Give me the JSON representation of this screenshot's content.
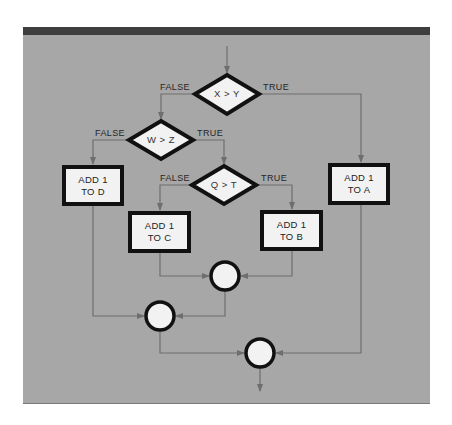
{
  "diagram": {
    "type": "flowchart",
    "colors": {
      "background": "#a7a7a7",
      "top_bar": "#3e3e3e",
      "shape_fill": "#f2f2f2",
      "shape_border": "#111111",
      "connector": "#6e6e6e"
    },
    "decisions": [
      {
        "id": "d1",
        "label": "X > Y",
        "false_label": "FALSE",
        "true_label": "TRUE"
      },
      {
        "id": "d2",
        "label": "W > Z",
        "false_label": "FALSE",
        "true_label": "TRUE"
      },
      {
        "id": "d3",
        "label": "Q > T",
        "false_label": "FALSE",
        "true_label": "TRUE"
      }
    ],
    "processes": [
      {
        "id": "pA",
        "line1": "ADD 1",
        "line2": "TO A"
      },
      {
        "id": "pB",
        "line1": "ADD 1",
        "line2": "TO B"
      },
      {
        "id": "pC",
        "line1": "ADD 1",
        "line2": "TO C"
      },
      {
        "id": "pD",
        "line1": "ADD 1",
        "line2": "TO D"
      }
    ],
    "connectors": [
      {
        "id": "j1",
        "joins": [
          "pC",
          "pB"
        ]
      },
      {
        "id": "j2",
        "joins": [
          "pD",
          "j1"
        ]
      },
      {
        "id": "j3",
        "joins": [
          "j2",
          "pA"
        ]
      }
    ]
  }
}
